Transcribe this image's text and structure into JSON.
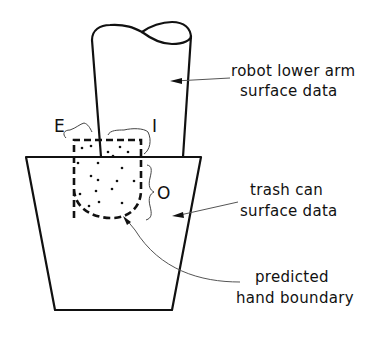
{
  "diagram": {
    "labels": {
      "arm_line1": "robot lower arm",
      "arm_line2": "surface data",
      "can_line1": "trash can",
      "can_line2": "surface data",
      "hand_line1": "predicted",
      "hand_line2": "hand boundary",
      "region_e": "E",
      "region_i": "I",
      "region_o": "O"
    },
    "colors": {
      "stroke": "#111111",
      "leader": "#555555",
      "background": "#ffffff"
    }
  }
}
